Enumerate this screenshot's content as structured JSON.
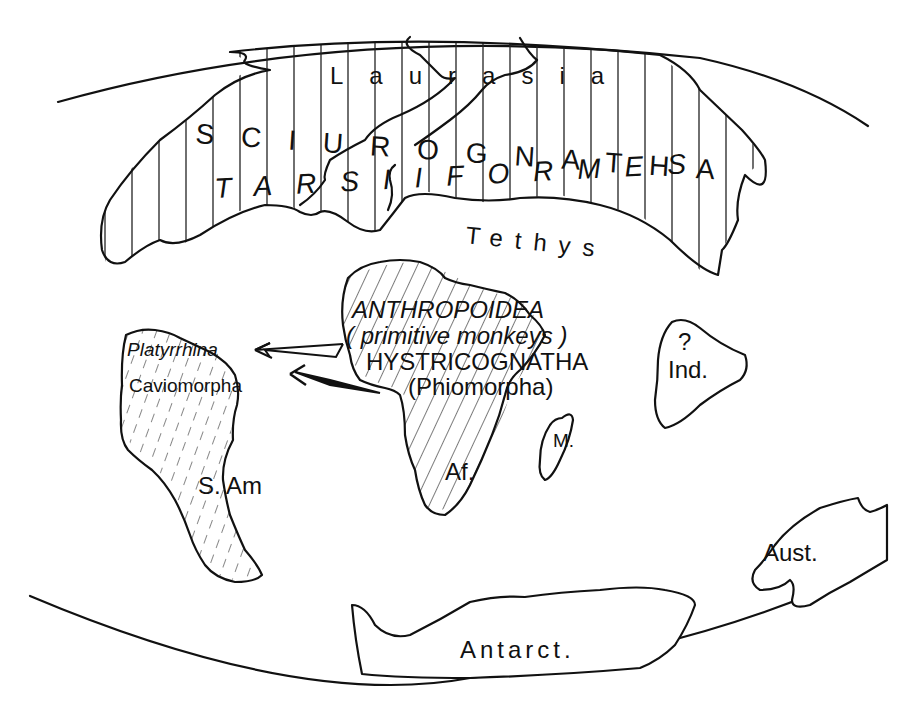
{
  "map": {
    "title": "Paleogeographic map: dispersal of primates and rodents from Africa to South America",
    "colors": {
      "ink": "#111111",
      "paper": "#ffffff"
    },
    "regions": {
      "laurasia": {
        "label": "Laurasia"
      },
      "sciurognatha": {
        "label": "SCIUROGNATHA"
      },
      "tarsiiformes": {
        "label": "TARSIIFORMES"
      },
      "tethys": {
        "label": "Tethys"
      },
      "africa": {
        "label": "Af.",
        "taxon1": "ANTHROPOIDEA",
        "taxon1_note": "( primitive monkeys )",
        "taxon2": "HYSTRICOGNATHA",
        "taxon2_note": "(Phiomorpha)"
      },
      "south_america": {
        "label": "S. Am",
        "taxon1": "Platyrrhina",
        "taxon2": "Caviomorpha"
      },
      "india": {
        "label": "Ind.",
        "query": "?"
      },
      "madagascar": {
        "label": "M."
      },
      "australia": {
        "label": "Aust."
      },
      "antarctica": {
        "label": "Antarct."
      }
    },
    "arrows": [
      {
        "name": "primate-dispersal-arrow",
        "from": "Africa",
        "to": "South America",
        "style": "open"
      },
      {
        "name": "rodent-dispersal-arrow",
        "from": "Africa",
        "to": "South America",
        "style": "filled"
      }
    ]
  }
}
